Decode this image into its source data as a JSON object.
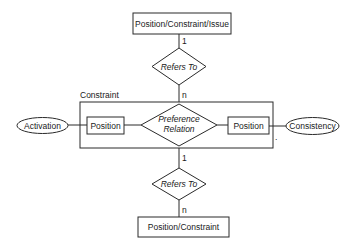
{
  "diagram": {
    "type": "entity-relationship",
    "entities": {
      "top": {
        "label": "Position/Constraint/Issue"
      },
      "bottom": {
        "label": "Position/Constraint"
      },
      "constraint_group": {
        "label": "Constraint"
      },
      "left_position": {
        "label": "Position"
      },
      "right_position": {
        "label": "Position"
      }
    },
    "relationships": {
      "top_refers": {
        "label": "Refers To",
        "card_top": "1",
        "card_bottom": "n"
      },
      "preference": {
        "line1": "Preference",
        "line2": "Relation"
      },
      "bottom_refers": {
        "label": "Refers To",
        "card_top": "1",
        "card_bottom": "n"
      }
    },
    "attributes": {
      "activation": {
        "label": "Activation"
      },
      "consistency": {
        "label": "Consistency"
      }
    },
    "stray_mark": "."
  }
}
